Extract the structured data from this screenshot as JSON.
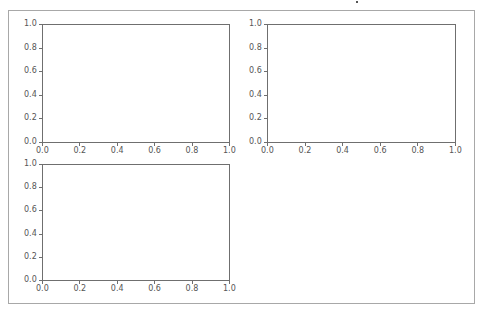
{
  "figure": {
    "background": "#ffffff",
    "border_color": "#a8a8a8",
    "axes_color": "#6f6f6f",
    "tick_label_color": "#555555"
  },
  "chart_data": [
    {
      "type": "line",
      "position": "top-left",
      "title": "",
      "xlabel": "",
      "ylabel": "",
      "xlim": [
        0.0,
        1.0
      ],
      "ylim": [
        0.0,
        1.0
      ],
      "x_ticks": [
        "0.0",
        "0.2",
        "0.4",
        "0.6",
        "0.8",
        "1.0"
      ],
      "y_ticks": [
        "0.0",
        "0.2",
        "0.4",
        "0.6",
        "0.8",
        "1.0"
      ],
      "grid": false,
      "series": []
    },
    {
      "type": "line",
      "position": "top-right",
      "title": "",
      "xlabel": "",
      "ylabel": "",
      "xlim": [
        0.0,
        1.0
      ],
      "ylim": [
        0.0,
        1.0
      ],
      "x_ticks": [
        "0.0",
        "0.2",
        "0.4",
        "0.6",
        "0.8",
        "1.0"
      ],
      "y_ticks": [
        "0.0",
        "0.2",
        "0.4",
        "0.6",
        "0.8",
        "1.0"
      ],
      "grid": false,
      "series": []
    },
    {
      "type": "line",
      "position": "bottom-left",
      "title": "",
      "xlabel": "",
      "ylabel": "",
      "xlim": [
        0.0,
        1.0
      ],
      "ylim": [
        0.0,
        1.0
      ],
      "x_ticks": [
        "0.0",
        "0.2",
        "0.4",
        "0.6",
        "0.8",
        "1.0"
      ],
      "y_ticks": [
        "0.0",
        "0.2",
        "0.4",
        "0.6",
        "0.8",
        "1.0"
      ],
      "grid": false,
      "series": []
    }
  ]
}
